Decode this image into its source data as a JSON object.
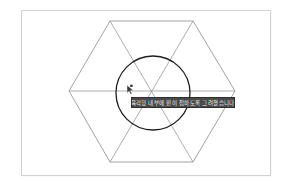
{
  "app": {
    "title": "Geometry Drawing Canvas"
  },
  "canvas": {
    "background_color": "#ffffff",
    "border_color": "#d2d2d2",
    "width": 250,
    "height": 166
  },
  "shapes": {
    "hexagon": {
      "name": "hexagon",
      "stroke_color": "#8a8a8a",
      "points": "110,21 193,21 235,91 193,162 110,162 69,91"
    },
    "diagonals": {
      "name": "hexagon-diagonals",
      "stroke_color": "#8a8a8a",
      "lines": [
        {
          "x1": 69,
          "y1": 91,
          "x2": 235,
          "y2": 91
        },
        {
          "x1": 110,
          "y1": 21,
          "x2": 193,
          "y2": 162
        },
        {
          "x1": 193,
          "y1": 21,
          "x2": 110,
          "y2": 162
        }
      ]
    },
    "circle": {
      "name": "inscribed-circle",
      "stroke_color": "#1f1f1f",
      "cx": 153,
      "cy": 93,
      "r": 37
    }
  },
  "tooltip": {
    "text": "육각형 내부에 원이 접하도록 그려졌습니다",
    "background_color": "#4a4a4a",
    "text_color": "#e8e8e8"
  },
  "cursor": {
    "icon": "arrow-cursor",
    "x": 125,
    "y": 84
  }
}
